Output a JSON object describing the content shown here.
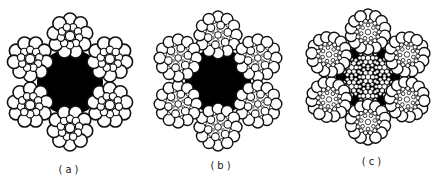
{
  "figure": {
    "background": "#ffffff",
    "ink": "#111111",
    "panels": [
      {
        "id": "a",
        "label": "(a)",
        "label_pos": [
          70,
          164
        ],
        "center": [
          70,
          82
        ],
        "strand_distance": 46,
        "strand_radius": 23,
        "strand_type": "seale-19",
        "core": "fiber-black",
        "core_radius": 30
      },
      {
        "id": "b",
        "label": "(b)",
        "label_pos": [
          222,
          160
        ],
        "center": [
          218,
          81
        ],
        "strand_distance": 46,
        "strand_radius": 24,
        "strand_type": "filler-25",
        "core": "fiber-black",
        "core_radius": 30
      },
      {
        "id": "c",
        "label": "(c)",
        "label_pos": [
          373,
          156
        ],
        "center": [
          368,
          77
        ],
        "strand_distance": 45,
        "strand_radius": 23,
        "strand_type": "warrington-seale-36",
        "core": "iwrc",
        "core_radius": 28
      }
    ]
  }
}
